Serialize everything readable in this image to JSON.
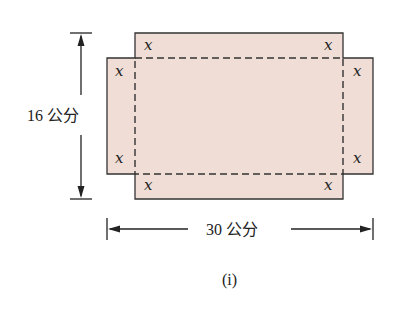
{
  "diagram": {
    "fill_color": "#EFDDD6",
    "stroke_color": "#333333",
    "corner_label": "x",
    "height_label": "16 公分",
    "width_label": "30 公分",
    "caption": "(i)",
    "corner_labels": [
      {
        "pos": "top-left-top",
        "text": "x"
      },
      {
        "pos": "top-right-top",
        "text": "x"
      },
      {
        "pos": "top-left-side",
        "text": "x"
      },
      {
        "pos": "top-right-side",
        "text": "x"
      },
      {
        "pos": "bottom-left-side",
        "text": "x"
      },
      {
        "pos": "bottom-right-side",
        "text": "x"
      },
      {
        "pos": "bottom-left-bottom",
        "text": "x"
      },
      {
        "pos": "bottom-right-bottom",
        "text": "x"
      }
    ]
  }
}
